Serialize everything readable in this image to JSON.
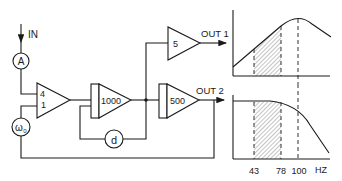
{
  "diagram": {
    "input": {
      "label": "IN"
    },
    "nodes": {
      "A": {
        "label": "A"
      },
      "omega": {
        "label": "ω",
        "subscript": "0"
      },
      "d": {
        "label": "d"
      }
    },
    "amplifiers": {
      "summing": {
        "gain_top": "4",
        "gain_bottom": "1"
      },
      "amp1000": {
        "gain": "1000"
      },
      "amp5": {
        "gain": "5"
      },
      "amp500": {
        "gain": "500"
      }
    },
    "outputs": {
      "out1": {
        "label": "OUT 1"
      },
      "out2": {
        "label": "OUT 2"
      }
    },
    "graphs": {
      "freq_axis": {
        "ticks": [
          "43",
          "78",
          "100"
        ],
        "unit": "HZ"
      },
      "top": {
        "shape": "bandpass peak at 100 Hz, shaded 43–78 Hz"
      },
      "bottom": {
        "shape": "lowpass flat then rolloff past 100 Hz, shaded 43–78 Hz"
      }
    },
    "colors": {
      "ink": "#1a1a1a",
      "background": "#ffffff"
    }
  }
}
